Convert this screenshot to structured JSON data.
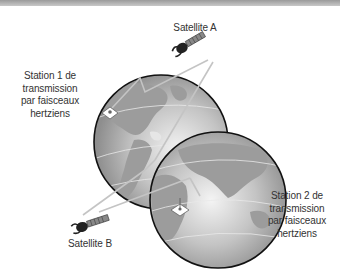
{
  "diagram": {
    "type": "satellite-relay",
    "colors": {
      "background": "#ffffff",
      "top_bar": "#b0b0b0",
      "globe_fill": "#bdbdbd",
      "globe_outline": "#111111",
      "beam": "#c8c8c8",
      "text": "#333333"
    },
    "labels": {
      "satellite_a": "Satellite A",
      "satellite_b": "Satellite B",
      "station_1": [
        "Station 1 de",
        "transmission",
        "par faisceaux",
        "hertziens"
      ],
      "station_2": [
        "Station 2 de",
        "transmission",
        "par faisceaux",
        "hertziens"
      ]
    },
    "nodes": [
      {
        "id": "satellite-a",
        "icon": "satellite-icon"
      },
      {
        "id": "satellite-b",
        "icon": "satellite-icon"
      },
      {
        "id": "station-1",
        "icon": "ground-station-icon",
        "on": "globe-americas"
      },
      {
        "id": "station-2",
        "icon": "ground-station-icon",
        "on": "globe-africa-asia"
      }
    ],
    "links": [
      {
        "from": "station-1",
        "to": "satellite-a"
      },
      {
        "from": "satellite-a",
        "to": "satellite-b"
      },
      {
        "from": "satellite-b",
        "to": "station-2"
      }
    ]
  }
}
